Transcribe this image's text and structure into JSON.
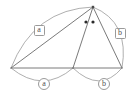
{
  "figure": {
    "canvas": {
      "width": 137,
      "height": 97,
      "background": "#ffffff"
    },
    "colors": {
      "segment": "#6b6b6b",
      "arc": "#9a9a9a",
      "label_text": "#4f4f4f",
      "label_border": "#9a9a9a",
      "dot": "#2a2a2a"
    },
    "vertices": [
      {
        "name": "apex",
        "label": "",
        "x": 93,
        "y": 7
      },
      {
        "name": "left",
        "label": "",
        "x": 11,
        "y": 68
      },
      {
        "name": "middle",
        "label": "",
        "x": 73,
        "y": 68
      },
      {
        "name": "right",
        "label": "",
        "x": 122,
        "y": 68
      }
    ],
    "segments": [
      {
        "name": "left-to-apex",
        "from": "left",
        "to": "apex"
      },
      {
        "name": "left-to-middle-baseline",
        "from": "left",
        "to": "middle"
      },
      {
        "name": "middle-to-right-baseline",
        "from": "middle",
        "to": "right"
      },
      {
        "name": "middle-to-apex",
        "from": "middle",
        "to": "apex"
      },
      {
        "name": "right-to-apex",
        "from": "right",
        "to": "apex"
      }
    ],
    "arcs": [
      {
        "name": "arc-upper-left",
        "from": "left",
        "to": "apex",
        "bulge": "outward-up"
      },
      {
        "name": "arc-upper-right",
        "from": "apex",
        "to": "right",
        "bulge": "outward-right"
      },
      {
        "name": "arc-lower-left",
        "from": "left",
        "to": "middle",
        "bulge": "downward"
      },
      {
        "name": "arc-lower-right",
        "from": "middle",
        "to": "right",
        "bulge": "downward"
      }
    ],
    "angle_marks": [
      {
        "name": "angle-dot-left",
        "x": 86,
        "y": 22
      },
      {
        "name": "angle-dot-right",
        "x": 93,
        "y": 22
      }
    ],
    "labels": {
      "upper_left": {
        "text": "a",
        "shape": "box",
        "x": 39,
        "y": 30
      },
      "upper_right": {
        "text": "b",
        "shape": "box",
        "x": 120,
        "y": 33
      },
      "lower_left": {
        "text": "a",
        "shape": "circle",
        "x": 44,
        "y": 84
      },
      "lower_right": {
        "text": "b",
        "shape": "circle",
        "x": 104,
        "y": 84
      }
    }
  }
}
